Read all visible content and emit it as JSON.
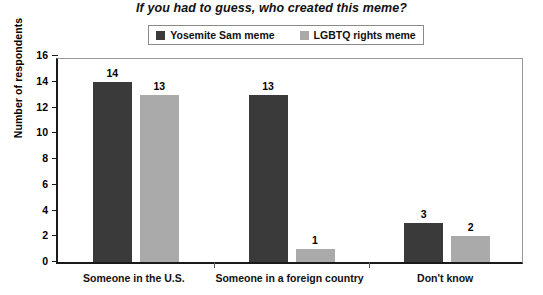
{
  "chart_data": {
    "type": "bar",
    "title": "If you had to guess, who created this meme?",
    "xlabel": "",
    "ylabel": "Number of respondents",
    "ylim": [
      0,
      16
    ],
    "ytick_step": 2,
    "yticks": [
      "16",
      "14",
      "12",
      "10",
      "8",
      "6",
      "4",
      "2",
      "0"
    ],
    "grid": false,
    "legend_position": "top-center",
    "categories": [
      "Someone in the U.S.",
      "Someone in a foreign country",
      "Don't know"
    ],
    "series": [
      {
        "name": "Yosemite Sam meme",
        "color": "#3a3a3a",
        "values": [
          14,
          13,
          3
        ],
        "value_labels": [
          "14",
          "3",
          "0"
        ]
      },
      {
        "name": "LGBTQ rights meme",
        "color": "#aaaaaa",
        "values": [
          13,
          1,
          2
        ],
        "value_labels": [
          "13",
          "1",
          "2"
        ]
      }
    ],
    "data_points": [
      {
        "category": "Someone in the U.S.",
        "series": "Yosemite Sam meme",
        "value": 14,
        "label": "14"
      },
      {
        "category": "Someone in the U.S.",
        "series": "LGBTQ rights meme",
        "value": 13,
        "label": "13"
      },
      {
        "category": "Someone in a foreign country",
        "series": "Yosemite Sam meme",
        "value": 3,
        "label": "3"
      },
      {
        "category": "Someone in a foreign country",
        "series": "LGBTQ rights meme",
        "value": 1,
        "label": "1"
      },
      {
        "category": "Don't know",
        "series": "Yosemite Sam meme",
        "value": 0,
        "label": "0"
      },
      {
        "category": "Don't know",
        "series": "LGBTQ rights meme",
        "value": 2,
        "label": "2"
      }
    ]
  },
  "legend": {
    "entries": [
      {
        "label": "Yosemite Sam meme",
        "color": "#3a3a3a"
      },
      {
        "label": "LGBTQ rights meme",
        "color": "#aaaaaa"
      }
    ]
  },
  "colors": {
    "series_dark": "#3a3a3a",
    "series_light": "#aaaaaa",
    "axis": "#1a1a1a",
    "frame": "#9a9a9a",
    "text": "#000000",
    "background": "#ffffff"
  }
}
